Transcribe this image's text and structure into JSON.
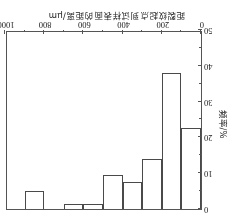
{
  "chart_data": {
    "type": "bar",
    "title": "",
    "xlabel": "距裂纹起点到试样表面的距离/μm",
    "ylabel": "频率/%",
    "categories": [
      "0-100",
      "100-200",
      "200-300",
      "300-400",
      "400-500",
      "500-600",
      "600-700",
      "700-800",
      "800-900",
      "900-1000"
    ],
    "bin_edges": [
      0,
      100,
      200,
      300,
      400,
      500,
      600,
      700,
      800,
      900,
      1000
    ],
    "values": [
      22.5,
      38,
      14,
      7.5,
      9.5,
      1.5,
      1.5,
      0,
      5,
      0
    ],
    "xlim": [
      0,
      1000
    ],
    "ylim": [
      0,
      50
    ],
    "xticks": [
      0,
      200,
      400,
      600,
      800,
      1000
    ],
    "yticks": [
      0,
      10,
      20,
      30,
      40,
      50
    ],
    "xtick_labels": [
      "0",
      "200",
      "400",
      "600",
      "800",
      "1000"
    ],
    "ytick_labels": [
      "0",
      "10",
      "20",
      "30",
      "40",
      "50"
    ],
    "grid": false,
    "legend": null,
    "bar_fill_color": "#ffffff",
    "bar_edge_color": "#4a4a4a",
    "axis_color": "#555555",
    "orientation_note": "图像整体旋转180度"
  }
}
